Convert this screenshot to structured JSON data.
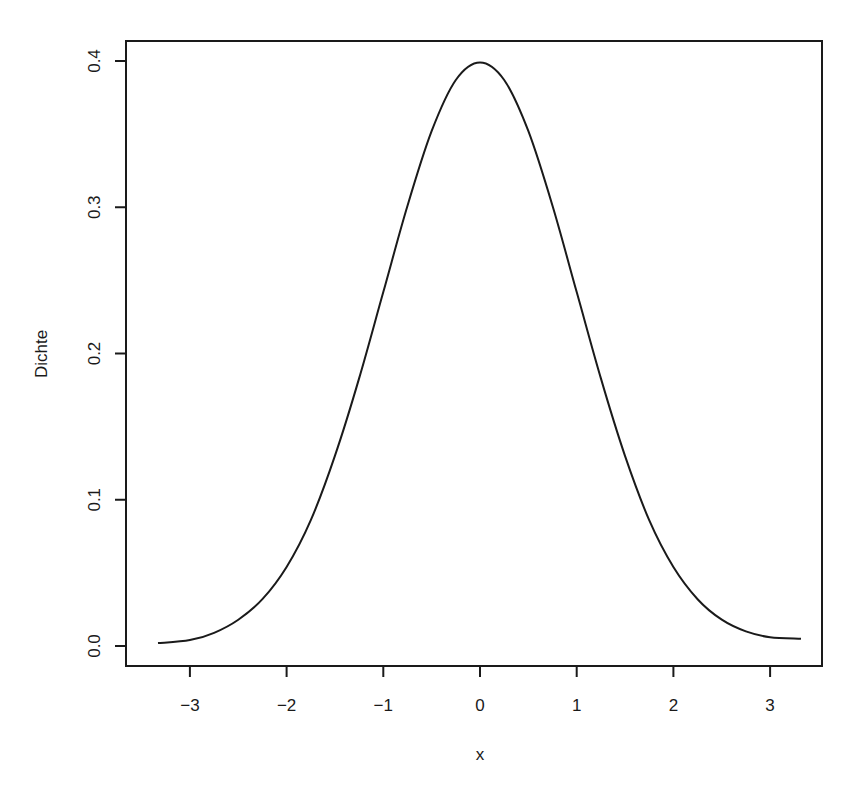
{
  "chart_data": {
    "type": "line",
    "title": "",
    "xlabel": "x",
    "ylabel": "Dichte",
    "xlim": [
      -3.6,
      3.6
    ],
    "ylim": [
      0.0,
      0.4
    ],
    "grid": false,
    "legend": null,
    "x_ticks": [
      -3,
      -2,
      -1,
      0,
      1,
      2,
      3
    ],
    "x_tick_labels": [
      "−3",
      "−2",
      "−1",
      "0",
      "1",
      "2",
      "3"
    ],
    "y_ticks": [
      0.0,
      0.1,
      0.2,
      0.3,
      0.4
    ],
    "y_tick_labels": [
      "0.0",
      "0.1",
      "0.2",
      "0.3",
      "0.4"
    ],
    "series": [
      {
        "name": "Dichte",
        "color": "#1a1a1a",
        "x": [
          -3.33,
          -3.0,
          -2.75,
          -2.5,
          -2.25,
          -2.0,
          -1.75,
          -1.5,
          -1.25,
          -1.0,
          -0.75,
          -0.5,
          -0.25,
          0.0,
          0.25,
          0.5,
          0.75,
          1.0,
          1.25,
          1.5,
          1.75,
          2.0,
          2.25,
          2.5,
          2.75,
          3.0,
          3.32
        ],
        "y": [
          0.002,
          0.004,
          0.009,
          0.018,
          0.032,
          0.054,
          0.086,
          0.13,
          0.183,
          0.242,
          0.301,
          0.352,
          0.387,
          0.399,
          0.387,
          0.352,
          0.301,
          0.242,
          0.183,
          0.13,
          0.086,
          0.054,
          0.032,
          0.018,
          0.01,
          0.006,
          0.005
        ]
      }
    ]
  },
  "labels": {
    "xlabel": "x",
    "ylabel": "Dichte"
  }
}
